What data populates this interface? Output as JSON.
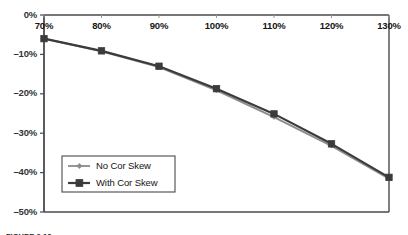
{
  "chart_data": {
    "type": "line",
    "title": "",
    "xlabel": "",
    "ylabel": "",
    "x": [
      "70%",
      "80%",
      "90%",
      "100%",
      "110%",
      "120%",
      "130%"
    ],
    "x_values": [
      70,
      80,
      90,
      100,
      110,
      120,
      130
    ],
    "xlim": [
      70,
      130
    ],
    "ylim": [
      -50,
      0
    ],
    "y_ticks": [
      "0%",
      "-10%",
      "-20%",
      "-30%",
      "-40%",
      "-50%"
    ],
    "y_tick_values": [
      0,
      -10,
      -20,
      -30,
      -40,
      -50
    ],
    "grid": false,
    "legend_position": "inside-lower-left",
    "series": [
      {
        "name": "No Cor Skew",
        "color": "#8c8c8c",
        "marker": "diamond",
        "values": [
          -6.0,
          -9.2,
          -13.2,
          -19.1,
          -25.9,
          -33.2,
          -41.5
        ]
      },
      {
        "name": "With Cor Skew",
        "color": "#3b3b3b",
        "marker": "square",
        "values": [
          -6.0,
          -9.1,
          -13.0,
          -18.7,
          -25.1,
          -32.7,
          -41.2
        ]
      }
    ]
  },
  "axes": {
    "y_ticks": [
      {
        "label": "0%",
        "value": 0
      },
      {
        "label": "-10%",
        "value": -10
      },
      {
        "label": "-20%",
        "value": -20
      },
      {
        "label": "-30%",
        "value": -30
      },
      {
        "label": "-40%",
        "value": -40
      },
      {
        "label": "-50%",
        "value": -50
      }
    ],
    "x_ticks": [
      {
        "label": "70%",
        "value": 70
      },
      {
        "label": "80%",
        "value": 80
      },
      {
        "label": "90%",
        "value": 90
      },
      {
        "label": "100%",
        "value": 100
      },
      {
        "label": "110%",
        "value": 110
      },
      {
        "label": "120%",
        "value": 120
      },
      {
        "label": "130%",
        "value": 130
      }
    ]
  },
  "legend": {
    "items": [
      {
        "label": "No Cor Skew",
        "color": "#8c8c8c",
        "marker": "diamond"
      },
      {
        "label": "With Cor Skew",
        "color": "#3b3b3b",
        "marker": "square"
      }
    ]
  },
  "caption": {
    "text": "FIGURE 2-13"
  },
  "colors": {
    "axis": "#4a4a4a",
    "series_light": "#8c8c8c",
    "series_dark": "#3b3b3b",
    "text": "#1a1a1a",
    "background": "#ffffff"
  }
}
